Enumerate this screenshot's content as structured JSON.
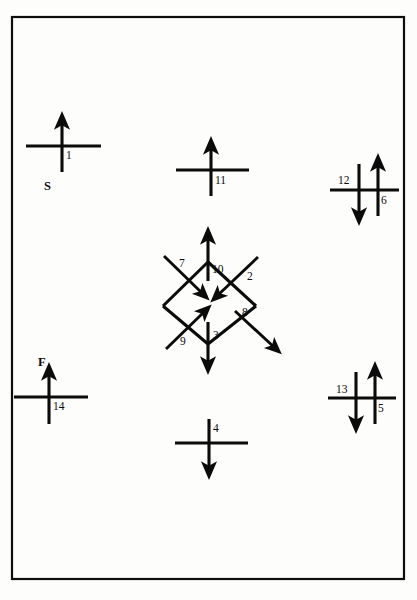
{
  "figure": {
    "canvas": {
      "width": 417,
      "height": 600
    },
    "frame": {
      "x": 12,
      "y": 17,
      "width": 392,
      "height": 562,
      "color": "#0d0d0d"
    },
    "stroke_color": "#0b0b0b",
    "background_color": "#fdfdfb"
  },
  "node_labels": [
    {
      "id": "S",
      "text": "S",
      "x": 46,
      "y": 190
    },
    {
      "id": "F",
      "text": "F",
      "x": 40,
      "y": 366
    }
  ],
  "crosses": [
    {
      "id": "cross-1",
      "number": "1",
      "label_x": 66,
      "label_y": 159,
      "center_x": 62,
      "center_y": 146,
      "vertical_direction": "up",
      "horizontal_arrow": "none"
    },
    {
      "id": "cross-11",
      "number": "11",
      "label_x": 216,
      "label_y": 184,
      "center_x": 211,
      "center_y": 170,
      "vertical_direction": "up",
      "horizontal_arrow": "none"
    },
    {
      "id": "cross-12",
      "number": "12",
      "label_x": 341,
      "label_y": 184,
      "center_x": 359,
      "center_y": 190,
      "vertical_direction": "down",
      "horizontal_arrow": "none"
    },
    {
      "id": "cross-6",
      "number": "6",
      "label_x": 379,
      "label_y": 204,
      "center_x": 375,
      "center_y": 190,
      "vertical_direction": "up",
      "horizontal_arrow": "none"
    },
    {
      "id": "cross-14",
      "number": "14",
      "label_x": 55,
      "label_y": 408,
      "center_x": 49,
      "center_y": 397,
      "vertical_direction": "up",
      "horizontal_arrow": "none"
    },
    {
      "id": "cross-4",
      "number": "4",
      "label_x": 214,
      "label_y": 434,
      "center_x": 209,
      "center_y": 443,
      "vertical_direction": "down",
      "horizontal_arrow": "none"
    },
    {
      "id": "cross-13",
      "number": "13",
      "label_x": 339,
      "label_y": 393,
      "center_x": 356,
      "center_y": 398,
      "vertical_direction": "down",
      "horizontal_arrow": "none"
    },
    {
      "id": "cross-5",
      "number": "5",
      "label_x": 377,
      "label_y": 412,
      "center_x": 373,
      "center_y": 398,
      "vertical_direction": "up",
      "horizontal_arrow": "none"
    }
  ],
  "diamond": {
    "id": "central-diamond",
    "top": {
      "x": 208,
      "y": 262
    },
    "right": {
      "x": 256,
      "y": 306
    },
    "bottom": {
      "x": 208,
      "y": 343
    },
    "left": {
      "x": 163,
      "y": 306
    },
    "vertex_arrows": [
      {
        "id": "arrow-10",
        "number": "10",
        "label_x": 213,
        "label_y": 272,
        "direction": "up",
        "at": "top-vertex",
        "x": 208,
        "y": 262
      },
      {
        "id": "arrow-3",
        "number": "3",
        "label_x": 214,
        "label_y": 345,
        "direction": "down",
        "at": "bottom-vertex",
        "x": 208,
        "y": 343
      }
    ],
    "edge_arrows": [
      {
        "id": "arrow-7",
        "number": "7",
        "label_x": 180,
        "label_y": 268,
        "direction": "down-right",
        "edge": "upper-left",
        "points_into_diamond": true
      },
      {
        "id": "arrow-2",
        "number": "2",
        "label_x": 247,
        "label_y": 281,
        "direction": "down-left",
        "edge": "upper-right",
        "points_into_diamond": true
      },
      {
        "id": "arrow-9",
        "number": "9",
        "label_x": 182,
        "label_y": 344,
        "direction": "up-right",
        "edge": "lower-left",
        "points_into_diamond": true
      },
      {
        "id": "arrow-8",
        "number": "8",
        "label_x": 243,
        "label_y": 317,
        "direction": "down-right",
        "edge": "lower-right",
        "points_into_diamond": false
      }
    ]
  }
}
